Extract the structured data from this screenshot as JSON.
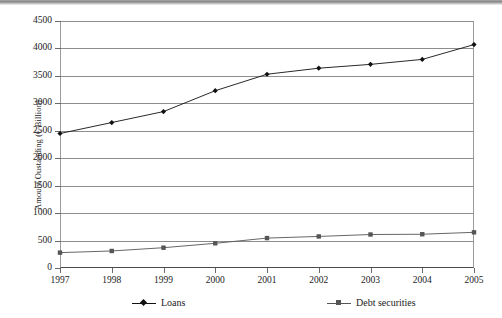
{
  "chart_data": {
    "type": "line",
    "title": "",
    "subtitle": "",
    "xlabel": "",
    "ylabel": "Amount Oustanding (€ Billion)",
    "categories": [
      "1997",
      "1998",
      "1999",
      "2000",
      "2001",
      "2002",
      "2003",
      "2004",
      "2005"
    ],
    "series": [
      {
        "name": "Loans",
        "marker": "diamond",
        "color": "#111111",
        "values": [
          2450,
          2650,
          2850,
          3230,
          3530,
          3640,
          3710,
          3800,
          4070
        ]
      },
      {
        "name": "Debt securities",
        "marker": "square",
        "color": "#555555",
        "values": [
          280,
          310,
          370,
          450,
          545,
          575,
          610,
          615,
          650
        ]
      }
    ],
    "ylim": [
      0,
      4500
    ],
    "yticks": [
      0,
      500,
      1000,
      1500,
      2000,
      2500,
      3000,
      3500,
      4000,
      4500
    ],
    "ytick_labels": [
      "0",
      "500",
      "1000",
      "1500",
      "2000",
      "2500",
      "3000",
      "3500",
      "4000",
      "4500"
    ],
    "xticks": [
      "1997",
      "1998",
      "1999",
      "2000",
      "2001",
      "2002",
      "2003",
      "2004",
      "2005"
    ],
    "grid": "horizontal",
    "legend_position": "bottom"
  },
  "legend": {
    "entries": [
      {
        "label": "Loans",
        "marker": "diamond-marker-icon"
      },
      {
        "label": "Debt securities",
        "marker": "square-marker-icon"
      }
    ]
  },
  "colors": {
    "loans": "#111111",
    "debt_securities": "#555555",
    "gridline": "#8d8d8d",
    "axis": "#4a4a4a",
    "background": "#ffffff"
  }
}
